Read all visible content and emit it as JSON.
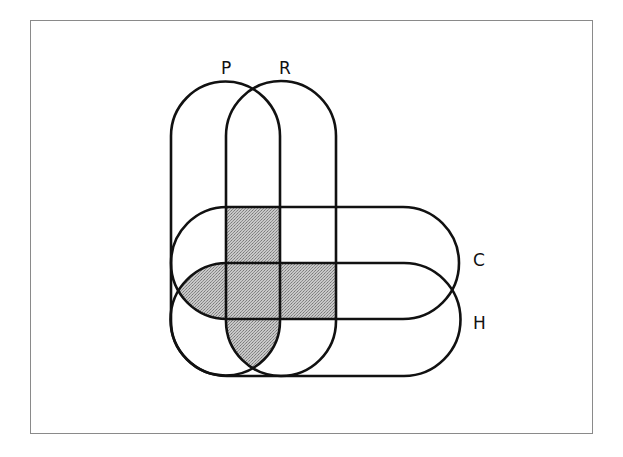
{
  "diagram": {
    "type": "venn-diagram",
    "sets": [
      {
        "id": "P",
        "label": "P",
        "shape": "vertical-stadium"
      },
      {
        "id": "R",
        "label": "R",
        "shape": "vertical-stadium"
      },
      {
        "id": "C",
        "label": "C",
        "shape": "horizontal-stadium"
      },
      {
        "id": "H",
        "label": "H",
        "shape": "horizontal-stadium"
      }
    ],
    "shaded_regions": [
      "P∩R∩C (not H)",
      "P∩C∩H (not R)",
      "P∩R∩C∩H",
      "R∩C∩H (not P)",
      "P∩R∩H (not C)"
    ],
    "colors": {
      "stroke": "#111111",
      "shade": "#b4b4b4",
      "frame": "#8a8a8a",
      "background": "#ffffff"
    }
  }
}
